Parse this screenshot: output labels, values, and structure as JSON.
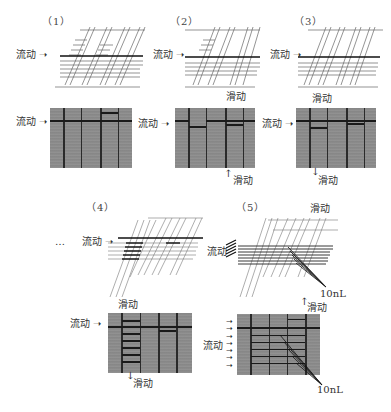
{
  "figure": {
    "panels": [
      {
        "id": "1",
        "label": "（1）",
        "flow_label": "流动",
        "gel_flow_label": "流动"
      },
      {
        "id": "2",
        "label": "（2）",
        "flow_label": "流动",
        "slide_label": "滑动",
        "gel_flow_label": "流动",
        "gel_slide_label": "滑动"
      },
      {
        "id": "3",
        "label": "（3）",
        "flow_label": "流动",
        "slide_label": "滑动",
        "gel_flow_label": "流动",
        "gel_slide_label": "滑动"
      },
      {
        "id": "4",
        "label": "（4）",
        "ellipsis": "…",
        "flow_label": "流动",
        "slide_label": "滑动",
        "gel_flow_label": "流动",
        "gel_slide_label": "滑动"
      },
      {
        "id": "5",
        "label": "（5）",
        "flow_label": "流动",
        "slide_label": "滑动",
        "volume_label": "10nL",
        "gel_flow_label": "流动",
        "gel_slide_label": "滑动",
        "gel_volume_label": "10nL"
      }
    ]
  },
  "colors": {
    "gel_background": "#8a8a8a",
    "line": "#1a1a1a",
    "schematic_stroke": "#555555"
  }
}
